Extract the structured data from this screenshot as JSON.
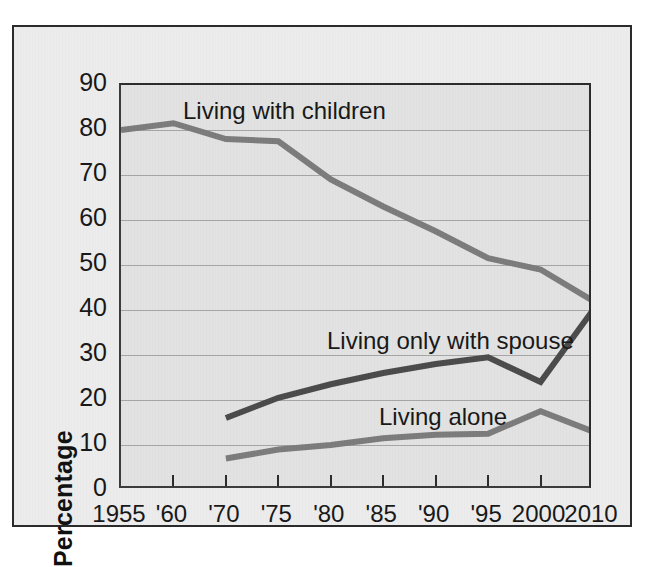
{
  "chart_data": {
    "type": "line",
    "title": "",
    "xlabel": "",
    "ylabel": "Percentage",
    "ylim": [
      0,
      90
    ],
    "ytick_step": 10,
    "yticks": [
      0,
      10,
      20,
      30,
      40,
      50,
      60,
      70,
      80,
      90
    ],
    "grid": true,
    "grid_orientation": "horizontal",
    "legend": "inline-labels",
    "categories": [
      "1955",
      "'60",
      "'70",
      "'75",
      "'80",
      "'85",
      "'90",
      "'95",
      "2000",
      "2010"
    ],
    "x_values": [
      1955,
      1960,
      1970,
      1975,
      1980,
      1985,
      1990,
      1995,
      2000,
      2010
    ],
    "series": [
      {
        "name": "Living with children",
        "color": "#7b7b7b",
        "values": [
          80,
          81.5,
          78,
          77.5,
          69,
          63,
          57.5,
          51.5,
          49,
          42
        ],
        "label_text": "Living with children"
      },
      {
        "name": "Living only with spouse",
        "color": "#4a4a4a",
        "values": [
          null,
          null,
          16,
          20.5,
          23.5,
          26,
          28,
          29.5,
          24,
          40
        ],
        "label_text": "Living only with spouse"
      },
      {
        "name": "Living alone",
        "color": "#7b7b7b",
        "values": [
          null,
          null,
          7,
          9,
          10,
          11.5,
          12.3,
          12.5,
          17.5,
          13
        ],
        "label_text": "Living alone"
      }
    ]
  },
  "axis": {
    "y_title": "Percentage",
    "y_tick_labels": [
      "90",
      "80",
      "70",
      "60",
      "50",
      "40",
      "30",
      "20",
      "10",
      "0"
    ],
    "x_tick_labels": [
      "1955",
      "'60",
      "'70",
      "'75",
      "'80",
      "'85",
      "'90",
      "'95",
      "2000",
      "2010"
    ]
  },
  "annotations": {
    "children_label": "Living with children",
    "spouse_label": "Living only with spouse",
    "alone_label": "Living alone"
  },
  "colors": {
    "frame_border": "#2b2b2b",
    "figure_background": "#ececec",
    "plot_background": "#e2e2e2",
    "gridline": "#9a9a9a",
    "children_line": "#7b7b7b",
    "spouse_line": "#4a4a4a",
    "alone_line": "#7b7b7b",
    "text": "#171717"
  }
}
